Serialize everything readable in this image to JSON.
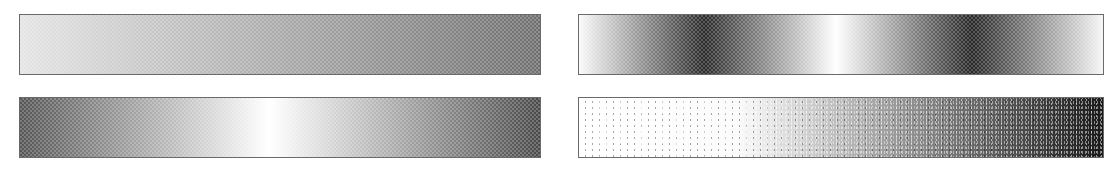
{
  "figure": {
    "swatches": [
      {
        "id": "top-left",
        "type": "linear-gradient",
        "dither": "ordered-halftone",
        "stops": [
          {
            "pos": 0.0,
            "color": "#e4e4e4"
          },
          {
            "pos": 1.0,
            "color": "#6f6f6f"
          }
        ]
      },
      {
        "id": "top-right",
        "type": "periodic-gradient",
        "dither": "ordered-halftone",
        "stops": [
          {
            "pos": 0.0,
            "color": "#fafafa"
          },
          {
            "pos": 0.24,
            "color": "#2a2a2a"
          },
          {
            "pos": 0.49,
            "color": "#ffffff"
          },
          {
            "pos": 0.75,
            "color": "#262626"
          },
          {
            "pos": 1.0,
            "color": "#f6f6f6"
          }
        ]
      },
      {
        "id": "bottom-left",
        "type": "symmetric-gradient",
        "dither": "ordered-halftone",
        "stops": [
          {
            "pos": 0.0,
            "color": "#555555"
          },
          {
            "pos": 0.48,
            "color": "#ffffff"
          },
          {
            "pos": 1.0,
            "color": "#4a4a4a"
          }
        ]
      },
      {
        "id": "bottom-right",
        "type": "linear-gradient",
        "dither": "error-diffusion-noise",
        "stops": [
          {
            "pos": 0.0,
            "color": "#ffffff"
          },
          {
            "pos": 0.3,
            "color": "#fbfbfb"
          },
          {
            "pos": 1.0,
            "color": "#1a1a1a"
          }
        ]
      }
    ],
    "border_color": "#6a6a6a",
    "background": "#ffffff"
  }
}
